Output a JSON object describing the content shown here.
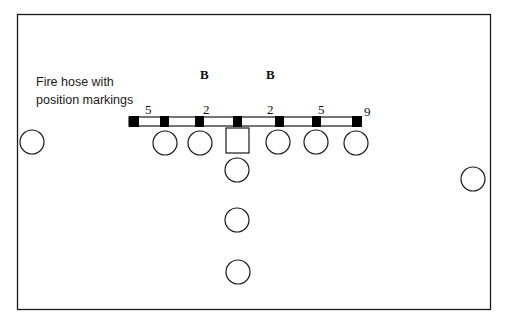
{
  "diagram": {
    "caption_line1": "Fire hose with",
    "caption_line2": "position markings",
    "back_labels": [
      "B",
      "B"
    ],
    "hose_numbers": [
      "5",
      "2",
      "2",
      "5",
      "9"
    ],
    "stroke_color": "#1a1a1a",
    "hose_fill": "#ffffff",
    "marker_fill": "#000000"
  }
}
